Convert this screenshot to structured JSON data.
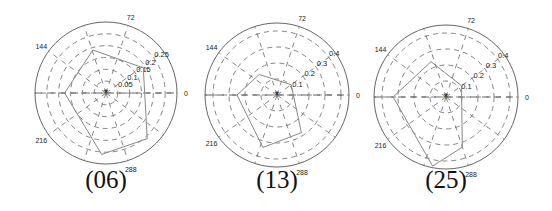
{
  "chart_data": [
    {
      "type": "polar",
      "caption": "(06)",
      "center": [
        106,
        93
      ],
      "outer_radius_px": 71,
      "r_max": 0.3,
      "radial_ticks": [
        0.05,
        0.1,
        0.15,
        0.2,
        0.25
      ],
      "radial_tick_labels": [
        "0.05",
        "0.1",
        "0.15",
        "0.2",
        "0.25"
      ],
      "angle_ticks": [
        0,
        72,
        144,
        216,
        288
      ],
      "angle_tick_labels": [
        "0",
        "72",
        "144",
        "216",
        "288"
      ],
      "grid": "dashed",
      "polygon": [
        {
          "angle": 34,
          "r": 0.19
        },
        {
          "angle": 107,
          "r": 0.19
        },
        {
          "angle": 180,
          "r": 0.175
        },
        {
          "angle": 266,
          "r": 0.26
        },
        {
          "angle": 312,
          "r": 0.26
        }
      ]
    },
    {
      "type": "polar",
      "caption": "(13)",
      "center": [
        277,
        95
      ],
      "outer_radius_px": 72,
      "r_max": 0.45,
      "radial_ticks": [
        0.1,
        0.2,
        0.3,
        0.4
      ],
      "radial_tick_labels": [
        "0.1",
        "0.2",
        "0.3",
        "0.4"
      ],
      "angle_ticks": [
        0,
        72,
        144,
        216,
        288
      ],
      "angle_tick_labels": [
        "0",
        "72",
        "144",
        "216",
        "288"
      ],
      "grid": "dashed",
      "polygon": [
        {
          "angle": 36,
          "r": 0.11
        },
        {
          "angle": 131,
          "r": 0.17
        },
        {
          "angle": 180,
          "r": 0.25
        },
        {
          "angle": 255,
          "r": 0.34
        },
        {
          "angle": 303,
          "r": 0.28
        }
      ]
    },
    {
      "type": "polar",
      "caption": "(25)",
      "center": [
        446,
        97
      ],
      "outer_radius_px": 72,
      "r_max": 0.45,
      "radial_ticks": [
        0.1,
        0.2,
        0.3,
        0.4
      ],
      "radial_tick_labels": [
        "0.1",
        "0.2",
        "0.3",
        "0.4"
      ],
      "angle_ticks": [
        0,
        72,
        144,
        216,
        288
      ],
      "angle_tick_labels": [
        "0",
        "72",
        "144",
        "216",
        "288"
      ],
      "grid": "dashed",
      "polygon": [
        {
          "angle": 36,
          "r": 0.12
        },
        {
          "angle": 113,
          "r": 0.24
        },
        {
          "angle": 180,
          "r": 0.33
        },
        {
          "angle": 259,
          "r": 0.44
        },
        {
          "angle": 288,
          "r": 0.33
        }
      ]
    }
  ]
}
